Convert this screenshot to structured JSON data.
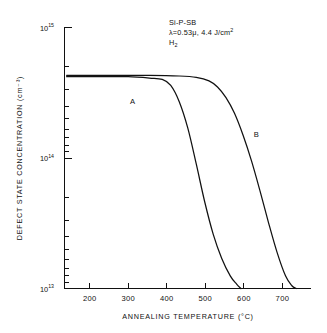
{
  "chart_data": {
    "type": "line",
    "title": "",
    "xlabel": "ANNEALING TEMPERATURE (°C)",
    "ylabel": "DEFECT STATE CONCENTRATION (cm⁻³)",
    "xlim": [
      150,
      730
    ],
    "ylim": [
      10000000000000.0,
      1000000000000000.0
    ],
    "yscale": "log",
    "xticks": [
      200,
      300,
      400,
      500,
      600,
      700
    ],
    "xtick_labels": [
      "200",
      "300",
      "400",
      "500",
      "600",
      "700"
    ],
    "yticks": [
      10000000000000.0,
      100000000000000.0,
      1000000000000000.0
    ],
    "ytick_labels": [
      "10¹³",
      "10¹⁴",
      "10¹⁵"
    ],
    "ytick_mantissa": "10",
    "ytick_exponents": [
      "13",
      "14",
      "15"
    ],
    "grid": false,
    "legend": "none",
    "series": [
      {
        "name": "A",
        "label": "A",
        "label_x": 310,
        "label_y": 260000000000000.0,
        "x": [
          155,
          200,
          250,
          300,
          350,
          380,
          400,
          420,
          440,
          460,
          480,
          500,
          520,
          540,
          555,
          565
        ],
        "y": [
          420000000000000.0,
          420000000000000.0,
          420000000000000.0,
          420000000000000.0,
          410000000000000.0,
          400000000000000.0,
          360000000000000.0,
          270000000000000.0,
          170000000000000.0,
          90000000000000.0,
          46000000000000.0,
          26000000000000.0,
          17000000000000.0,
          12500000000000.0,
          10800000000000.0,
          10000000000000.0
        ]
      },
      {
        "name": "B",
        "label": "B",
        "label_x": 601,
        "label_y": 145000000000000.0,
        "x": [
          155,
          250,
          350,
          420,
          460,
          490,
          510,
          530,
          550,
          570,
          590,
          610,
          630,
          650,
          670,
          685,
          695
        ],
        "y": [
          430000000000000.0,
          430000000000000.0,
          430000000000000.0,
          425000000000000.0,
          415000000000000.0,
          390000000000000.0,
          350000000000000.0,
          290000000000000.0,
          220000000000000.0,
          150000000000000.0,
          95000000000000.0,
          56000000000000.0,
          32000000000000.0,
          19000000000000.0,
          12500000000000.0,
          10500000000000.0,
          10000000000000.0
        ]
      }
    ],
    "annotations": [
      {
        "id": "sample",
        "text": "Si-P-SB"
      },
      {
        "id": "laser",
        "text": "λ=0.53μ, 4.4 J/cm²"
      },
      {
        "id": "ambient",
        "text": "H₂"
      }
    ],
    "annotation_block": {
      "line1": "Si-P-SB",
      "line2_prefix": "λ=0.53μ, 4.4 J/cm",
      "line2_sup": "2",
      "line3_prefix": "H",
      "line3_sub": "2"
    }
  }
}
